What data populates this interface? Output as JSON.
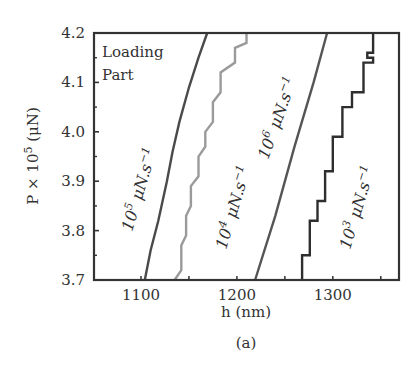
{
  "chart_data": {
    "type": "line",
    "title": "",
    "caption": "(a)",
    "xlabel": "h (nm)",
    "ylabel": "P × 10^5 (μN)",
    "ylabel_parts": {
      "prefix": "P × 10",
      "sup": "5",
      "suffix": " (μN)"
    },
    "xlim": [
      1051,
      1369
    ],
    "ylim": [
      3.7,
      4.2
    ],
    "x_ticks": [
      1100,
      1200,
      1300
    ],
    "x_minor_ticks": [
      1150,
      1250,
      1350
    ],
    "y_ticks": [
      3.7,
      3.8,
      3.9,
      4.0,
      4.1,
      4.2
    ],
    "y_tick_labels": [
      "3.7",
      "3.8",
      "3.9",
      "4.0",
      "4.1",
      "4.2"
    ],
    "grid": false,
    "legend": null,
    "annotations": [
      {
        "text": "Loading",
        "line": 1
      },
      {
        "text": "Part",
        "line": 2
      }
    ],
    "series": [
      {
        "name": "10^5 μN.s^-1",
        "label_base": "10",
        "label_exp": "5",
        "label_unit": " μN.s",
        "label_unit_exp": "−1",
        "color": "#4a4a4a",
        "style": "smooth",
        "points": [
          [
            1104,
            3.7
          ],
          [
            1110,
            3.76
          ],
          [
            1118,
            3.82
          ],
          [
            1127,
            3.9
          ],
          [
            1133,
            3.96
          ],
          [
            1140,
            4.02
          ],
          [
            1150,
            4.09
          ],
          [
            1160,
            4.15
          ],
          [
            1169,
            4.2
          ]
        ]
      },
      {
        "name": "10^4 μN.s^-1",
        "label_base": "10",
        "label_exp": "4",
        "label_unit": " μN.s",
        "label_unit_exp": "−1",
        "color": "#9a9a9a",
        "style": "stepped",
        "points": [
          [
            1135,
            3.7
          ],
          [
            1142,
            3.72
          ],
          [
            1142,
            3.77
          ],
          [
            1147,
            3.79
          ],
          [
            1147,
            3.83
          ],
          [
            1152,
            3.85
          ],
          [
            1152,
            3.89
          ],
          [
            1160,
            3.91
          ],
          [
            1160,
            3.95
          ],
          [
            1167,
            3.97
          ],
          [
            1167,
            4.0
          ],
          [
            1175,
            4.02
          ],
          [
            1175,
            4.06
          ],
          [
            1183,
            4.08
          ],
          [
            1183,
            4.12
          ],
          [
            1198,
            4.14
          ],
          [
            1198,
            4.17
          ],
          [
            1210,
            4.18
          ],
          [
            1210,
            4.2
          ]
        ]
      },
      {
        "name": "10^6 μN.s^-1",
        "label_base": "10",
        "label_exp": "6",
        "label_unit": " μN.s",
        "label_unit_exp": "−1",
        "color": "#555555",
        "style": "linear",
        "points": [
          [
            1219,
            3.7
          ],
          [
            1240,
            3.83
          ],
          [
            1260,
            3.97
          ],
          [
            1280,
            4.1
          ],
          [
            1294,
            4.2
          ]
        ]
      },
      {
        "name": "10^3 μN.s^-1",
        "label_base": "10",
        "label_exp": "3",
        "label_unit": " μN.s",
        "label_unit_exp": "−1",
        "color": "#2e2e2e",
        "style": "stepped",
        "points": [
          [
            1268,
            3.7
          ],
          [
            1268,
            3.75
          ],
          [
            1276,
            3.75
          ],
          [
            1276,
            3.82
          ],
          [
            1284,
            3.82
          ],
          [
            1284,
            3.86
          ],
          [
            1292,
            3.86
          ],
          [
            1292,
            3.92
          ],
          [
            1300,
            3.92
          ],
          [
            1300,
            3.99
          ],
          [
            1310,
            3.99
          ],
          [
            1310,
            4.05
          ],
          [
            1320,
            4.05
          ],
          [
            1320,
            4.08
          ],
          [
            1332,
            4.08
          ],
          [
            1332,
            4.14
          ],
          [
            1342,
            4.14
          ],
          [
            1342,
            4.15
          ],
          [
            1336,
            4.15
          ],
          [
            1336,
            4.16
          ],
          [
            1342,
            4.16
          ],
          [
            1342,
            4.2
          ]
        ]
      }
    ]
  }
}
